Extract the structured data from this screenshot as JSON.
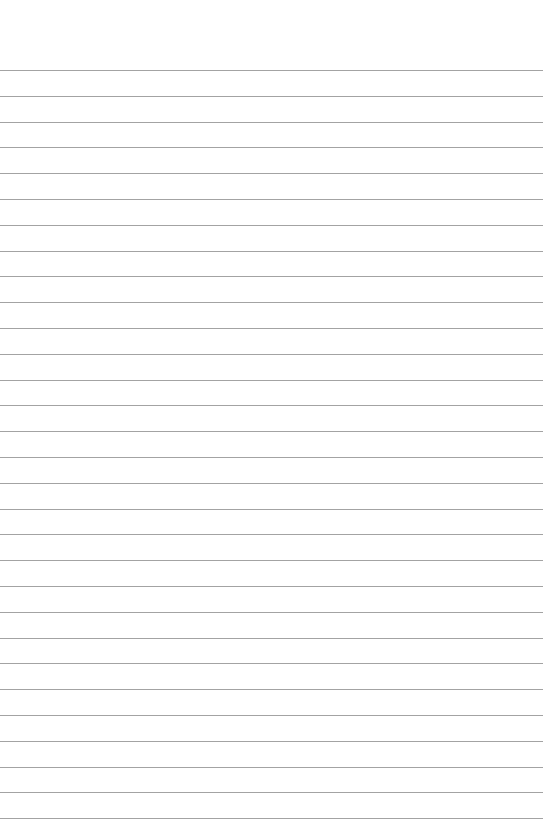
{
  "page": {
    "type": "ruled-paper",
    "background_color": "#ffffff",
    "line_color": "#a3a3a3",
    "line_count": 30,
    "first_line_y": 70,
    "line_spacing": 25.8,
    "line_width": 543
  },
  "header": {
    "faint_text": ""
  }
}
